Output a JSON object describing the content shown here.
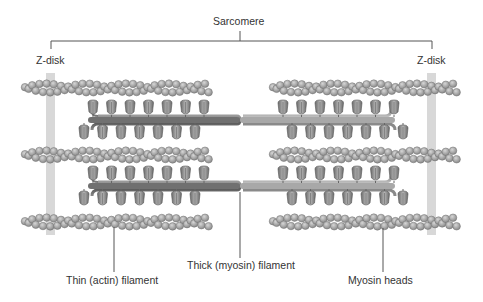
{
  "title": "Sarcomere",
  "labels": {
    "sarcomere": "Sarcomere",
    "z_disk_left": "Z-disk",
    "z_disk_right": "Z-disk",
    "thin_filament": "Thin (actin) filament",
    "thick_filament": "Thick (myosin) filament",
    "myosin_heads": "Myosin heads"
  },
  "colors": {
    "z_disk": "#d8d8d8",
    "actin_bead": "#a8a8a8",
    "actin_bead_stroke": "#6e6e6e",
    "myosin_head": "#8c8c8c",
    "thick_rod": "#7a7a7a",
    "leader_line": "#555555"
  },
  "structure": {
    "actin_rows_y": [
      88,
      155,
      222
    ],
    "thick_filaments_y": [
      120,
      186
    ],
    "z_disks_x": [
      51,
      432
    ],
    "myosin_heads_per_half_row": 7
  }
}
